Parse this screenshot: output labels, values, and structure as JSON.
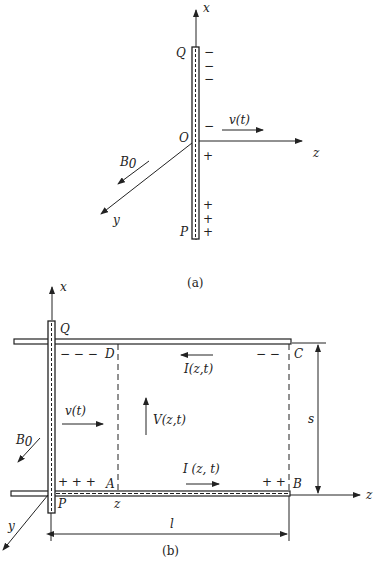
{
  "figure_a": {
    "caption": "(a)",
    "axes": {
      "x": "x",
      "y": "y",
      "z": "z"
    },
    "points": {
      "top": "Q",
      "origin": "O",
      "bottom": "P"
    },
    "velocity_label": "v(t)",
    "field_label": "B",
    "field_subscript": "0",
    "negative_charges": [
      "−",
      "−",
      "−",
      "−"
    ],
    "positive_charges": [
      "+",
      "+",
      "+",
      "+"
    ]
  },
  "figure_b": {
    "caption": "(b)",
    "axes": {
      "x": "x",
      "y": "y",
      "z": "z"
    },
    "corners": {
      "Q": "Q",
      "P": "P",
      "A": "A",
      "B": "B",
      "C": "C",
      "D": "D"
    },
    "velocity_label": "v(t)",
    "field_label": "B",
    "field_subscript": "0",
    "voltage_label": "V(z,t)",
    "current_top_label": "I(z,t)",
    "current_bottom_label": "I (z, t)",
    "position_label": "z",
    "length_label": "l",
    "separation_label": "s",
    "charges_top_left": "− − −",
    "charges_top_right": "− −",
    "charges_bottom_left": "+ + +",
    "charges_bottom_right": "+ +"
  }
}
